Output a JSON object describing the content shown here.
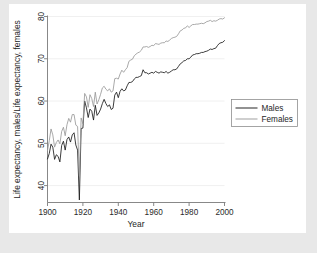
{
  "figure": {
    "background_color": "#ffffff",
    "canvas_color": "#e8e8e8"
  },
  "legend": {
    "entries": [
      {
        "label": "Males",
        "color": "#1a1a1a"
      },
      {
        "label": "Females",
        "color": "#9a9a9a"
      }
    ]
  },
  "chart_data": {
    "type": "line",
    "title": "",
    "xlabel": "Year",
    "ylabel": "Life expectancy, males/Life expectancy, females",
    "xlim": [
      1900,
      2000
    ],
    "ylim": [
      36,
      80
    ],
    "xticks": [
      1900,
      1920,
      1940,
      1960,
      1980,
      2000
    ],
    "yticks": [
      40,
      50,
      60,
      70,
      80
    ],
    "grid": true,
    "grid_axis": "y",
    "legend_position": "right-outside",
    "x": [
      1900,
      1901,
      1902,
      1903,
      1904,
      1905,
      1906,
      1907,
      1908,
      1909,
      1910,
      1911,
      1912,
      1913,
      1914,
      1915,
      1916,
      1917,
      1918,
      1919,
      1920,
      1921,
      1922,
      1923,
      1924,
      1925,
      1926,
      1927,
      1928,
      1929,
      1930,
      1931,
      1932,
      1933,
      1934,
      1935,
      1936,
      1937,
      1938,
      1939,
      1940,
      1941,
      1942,
      1943,
      1944,
      1945,
      1946,
      1947,
      1948,
      1949,
      1950,
      1951,
      1952,
      1953,
      1954,
      1955,
      1956,
      1957,
      1958,
      1959,
      1960,
      1961,
      1962,
      1963,
      1964,
      1965,
      1966,
      1967,
      1968,
      1969,
      1970,
      1971,
      1972,
      1973,
      1974,
      1975,
      1976,
      1977,
      1978,
      1979,
      1980,
      1981,
      1982,
      1983,
      1984,
      1985,
      1986,
      1987,
      1988,
      1989,
      1990,
      1991,
      1992,
      1993,
      1994,
      1995,
      1996,
      1997,
      1998,
      1999,
      2000
    ],
    "series": [
      {
        "name": "Males",
        "color": "#1a1a1a",
        "values": [
          46.3,
          47.6,
          49.8,
          49.1,
          46.2,
          47.3,
          46.9,
          45.6,
          49.5,
          50.5,
          48.4,
          50.9,
          51.5,
          50.3,
          52.0,
          52.5,
          49.6,
          48.4,
          36.6,
          53.5,
          53.6,
          60.0,
          58.4,
          56.1,
          58.1,
          57.6,
          55.5,
          59.0,
          56.6,
          57.2,
          58.1,
          59.4,
          60.4,
          59.4,
          58.7,
          59.1,
          58.0,
          58.3,
          61.4,
          62.1,
          60.8,
          62.3,
          62.9,
          62.4,
          62.6,
          63.6,
          64.4,
          64.4,
          64.6,
          65.2,
          65.6,
          65.6,
          65.8,
          66.0,
          67.4,
          66.7,
          66.7,
          66.4,
          66.6,
          66.8,
          66.6,
          67.0,
          66.8,
          66.6,
          66.9,
          66.8,
          66.7,
          67.0,
          66.6,
          66.8,
          67.1,
          67.4,
          67.4,
          67.6,
          68.2,
          68.8,
          69.1,
          69.5,
          69.6,
          70.0,
          70.0,
          70.4,
          70.9,
          71.0,
          71.2,
          71.2,
          71.3,
          71.5,
          71.5,
          71.7,
          71.8,
          72.0,
          72.3,
          72.2,
          72.4,
          72.5,
          73.1,
          73.6,
          73.8,
          73.9,
          74.3
        ]
      },
      {
        "name": "Females",
        "color": "#9a9a9a",
        "values": [
          48.3,
          50.6,
          53.4,
          52.0,
          49.1,
          50.2,
          50.8,
          49.9,
          52.8,
          53.8,
          51.8,
          54.4,
          55.9,
          55.0,
          56.8,
          56.8,
          54.3,
          54.0,
          42.2,
          56.0,
          54.6,
          61.8,
          61.0,
          58.5,
          61.5,
          60.6,
          58.7,
          62.1,
          59.3,
          60.3,
          61.6,
          63.1,
          63.5,
          62.8,
          62.4,
          62.9,
          62.1,
          62.4,
          65.3,
          65.4,
          65.2,
          66.4,
          67.3,
          66.8,
          67.4,
          67.9,
          69.4,
          69.7,
          69.9,
          70.7,
          71.1,
          71.4,
          71.6,
          72.0,
          72.8,
          72.8,
          72.9,
          72.7,
          72.9,
          73.2,
          73.1,
          73.6,
          73.5,
          73.4,
          73.7,
          73.8,
          73.8,
          74.2,
          74.1,
          74.4,
          74.8,
          75.0,
          75.1,
          75.3,
          75.9,
          76.6,
          76.8,
          77.2,
          77.3,
          77.8,
          77.4,
          77.8,
          78.1,
          78.1,
          78.2,
          78.2,
          78.3,
          78.4,
          78.3,
          78.5,
          78.8,
          78.9,
          79.1,
          78.8,
          79.0,
          78.9,
          79.1,
          79.4,
          79.5,
          79.4,
          79.7
        ]
      }
    ]
  }
}
